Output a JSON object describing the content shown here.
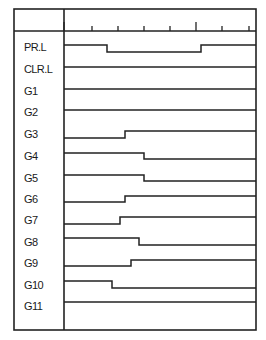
{
  "diagram": {
    "type": "timing-diagram",
    "frame": {
      "left": 14,
      "top": 9,
      "right": 256,
      "bottom": 330,
      "label_col_right": 64,
      "header_bottom": 31
    },
    "time_axis": {
      "ticks": [
        {
          "x": 64,
          "major": true
        },
        {
          "x": 92,
          "major": false
        },
        {
          "x": 118,
          "major": false
        },
        {
          "x": 144,
          "major": false
        },
        {
          "x": 170,
          "major": false
        },
        {
          "x": 196,
          "major": true
        },
        {
          "x": 222,
          "major": false
        },
        {
          "x": 249,
          "major": false
        }
      ]
    },
    "signals": [
      {
        "name": "PR.L",
        "label_y": 47,
        "high_y": 45,
        "low_y": 52,
        "initial": "high",
        "transitions": [
          107,
          201
        ]
      },
      {
        "name": "CLR.L",
        "label_y": 69,
        "high_y": 67,
        "low_y": 73,
        "initial": "high",
        "transitions": []
      },
      {
        "name": "G1",
        "label_y": 91,
        "high_y": 89,
        "low_y": 95,
        "initial": "high",
        "transitions": []
      },
      {
        "name": "G2",
        "label_y": 112,
        "high_y": 110,
        "low_y": 116,
        "initial": "high",
        "transitions": []
      },
      {
        "name": "G3",
        "label_y": 134,
        "high_y": 131,
        "low_y": 138,
        "initial": "low",
        "transitions": [
          125
        ]
      },
      {
        "name": "G4",
        "label_y": 156,
        "high_y": 153,
        "low_y": 159,
        "initial": "high",
        "transitions": [
          144
        ]
      },
      {
        "name": "G5",
        "label_y": 178,
        "high_y": 175,
        "low_y": 181,
        "initial": "high",
        "transitions": [
          144
        ]
      },
      {
        "name": "G6",
        "label_y": 199,
        "high_y": 196,
        "low_y": 202,
        "initial": "low",
        "transitions": [
          125
        ]
      },
      {
        "name": "G7",
        "label_y": 220,
        "high_y": 217,
        "low_y": 224,
        "initial": "low",
        "transitions": [
          120
        ]
      },
      {
        "name": "G8",
        "label_y": 242,
        "high_y": 238,
        "low_y": 245,
        "initial": "high",
        "transitions": [
          139
        ]
      },
      {
        "name": "G9",
        "label_y": 263,
        "high_y": 260,
        "low_y": 266,
        "initial": "low",
        "transitions": [
          131
        ]
      },
      {
        "name": "G10",
        "label_y": 285,
        "high_y": 281,
        "low_y": 288,
        "initial": "high",
        "transitions": [
          112
        ]
      },
      {
        "name": "G11",
        "label_y": 306,
        "high_y": 302,
        "low_y": 308,
        "initial": "high",
        "transitions": []
      }
    ]
  }
}
